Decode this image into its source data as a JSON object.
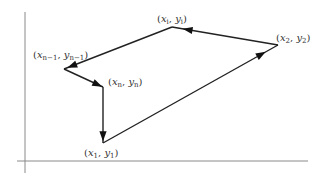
{
  "diagram": {
    "type": "directed-polygon-path",
    "vertices": [
      {
        "id": "v1",
        "label": {
          "var_x": "x",
          "var_y": "y",
          "sub_x": "1",
          "sub_y": "1"
        }
      },
      {
        "id": "v2",
        "label": {
          "var_x": "x",
          "var_y": "y",
          "sub_x": "2",
          "sub_y": "2"
        }
      },
      {
        "id": "vi",
        "label": {
          "var_x": "x",
          "var_y": "y",
          "sub_x": "i",
          "sub_y": "i"
        }
      },
      {
        "id": "vn1",
        "label": {
          "var_x": "x",
          "var_y": "y",
          "sub_x": "n−1",
          "sub_y": "n−1"
        }
      },
      {
        "id": "vn",
        "label": {
          "var_x": "x",
          "var_y": "y",
          "sub_x": "n",
          "sub_y": "n"
        }
      }
    ],
    "edges": [
      {
        "from": "v1",
        "to": "v2"
      },
      {
        "from": "v2",
        "to": "vi"
      },
      {
        "from": "vi",
        "to": "vn1"
      },
      {
        "from": "vn1",
        "to": "vn"
      },
      {
        "from": "vn",
        "to": "v1"
      }
    ],
    "colors": {
      "edge": "#222222",
      "axis": "#8a8a8a",
      "label": "#333333"
    }
  }
}
